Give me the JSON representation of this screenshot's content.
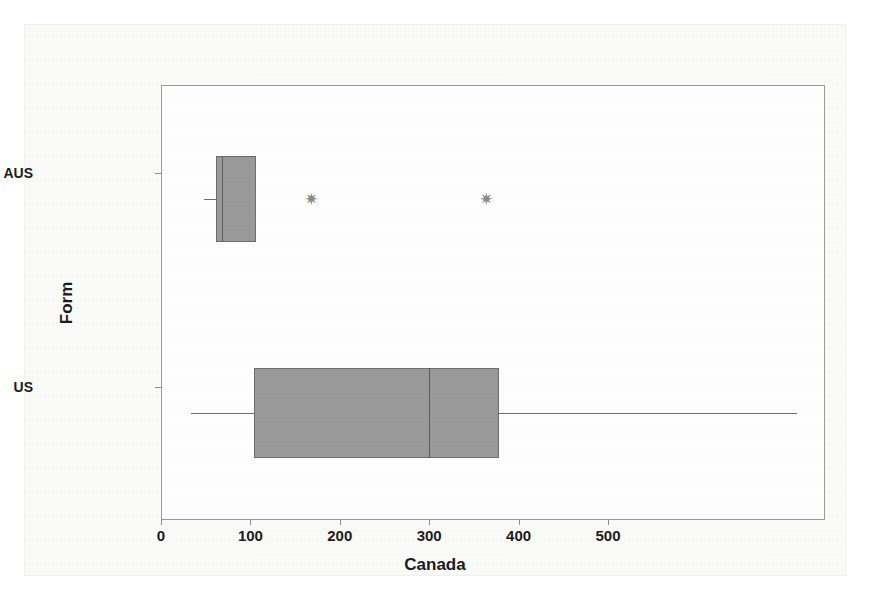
{
  "chart_data": {
    "type": "box",
    "title": "",
    "xlabel": "Canada",
    "ylabel": "Form",
    "orientation": "horizontal",
    "xlim": [
      -35,
      710
    ],
    "xticks": [
      0,
      100,
      200,
      300,
      400,
      500
    ],
    "xtick_labels": [
      "0",
      "100",
      "200",
      "300",
      "400",
      "500"
    ],
    "categories": [
      "AUS",
      "US"
    ],
    "grid": false,
    "legend": null,
    "box_fill_color": "#9a9a9a",
    "box_edge_color": "#6d6d6d",
    "outlier_marker": "✷",
    "boxes": [
      {
        "category": "AUS",
        "whisker_low": 19,
        "q1": 32,
        "median": 39,
        "q3": 77,
        "whisker_high": 77,
        "outliers": [
          139,
          335
        ]
      },
      {
        "category": "US",
        "whisker_low": 4,
        "q1": 75,
        "median": 271,
        "q3": 349,
        "whisker_high": 682,
        "outliers": []
      }
    ]
  },
  "axes": {
    "x_title": "Canada",
    "y_title": "Form",
    "x_tick_labels": [
      "0",
      "100",
      "200",
      "300",
      "400",
      "500"
    ],
    "y_tick_labels": [
      "AUS",
      "US"
    ]
  }
}
